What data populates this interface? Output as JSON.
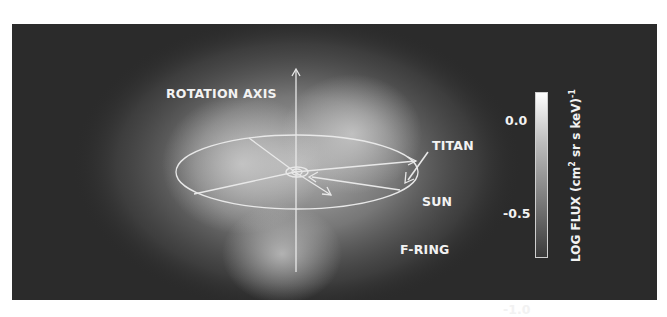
{
  "figure": {
    "labels": {
      "rotation_axis": "ROTATION AXIS",
      "titan": "TITAN",
      "sun": "SUN",
      "f_ring": "F-RING"
    },
    "colorbar": {
      "ticks": [
        "0.0",
        "-0.5",
        "-1.0"
      ],
      "title_prefix": "LOG FLUX (cm",
      "title_sup": "2",
      "title_mid": " sr s keV)",
      "title_exp": "-1",
      "range": [
        -1.0,
        0.0
      ],
      "colormap": "grayscale"
    },
    "colors": {
      "background": "#2b2b2b",
      "annotation": "#f2f2f2"
    }
  }
}
